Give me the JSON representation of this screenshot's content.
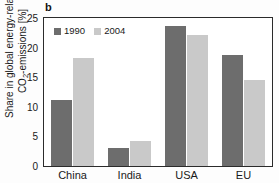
{
  "panel": {
    "label": "b"
  },
  "chart_data": {
    "type": "bar",
    "title": "",
    "subtitle": "",
    "panel_label": "b",
    "categories": [
      "China",
      "India",
      "USA",
      "EU"
    ],
    "series": [
      {
        "name": "1990",
        "color": "#6d6d6d",
        "values": [
          11.2,
          3.0,
          23.7,
          18.7
        ]
      },
      {
        "name": "2004",
        "color": "#c9c9c9",
        "values": [
          18.3,
          4.3,
          22.2,
          14.5
        ]
      }
    ],
    "xlabel": "",
    "ylabel": "Share in global energy-related CO2-emissions [%]",
    "ylabel_line1": "Share in global energy-related",
    "ylabel_line2_pre": "CO",
    "ylabel_line2_sub": "2",
    "ylabel_line2_post": "-emissions [%]",
    "ylim": [
      0,
      25
    ],
    "yticks": [
      0,
      5,
      10,
      15,
      20,
      25
    ],
    "ytick_labels": [
      "0",
      "5",
      "10",
      "15",
      "20",
      "25"
    ],
    "grid": false,
    "legend_position": "upper-left-inside",
    "frame": true
  },
  "legend": {
    "entries": [
      {
        "label": "1990",
        "color": "#6d6d6d"
      },
      {
        "label": "2004",
        "color": "#c9c9c9"
      }
    ]
  },
  "axis": {
    "y_tick_labels": [
      "25",
      "20",
      "15",
      "10",
      "5",
      "0"
    ],
    "x_tick_labels": [
      "China",
      "India",
      "USA",
      "EU"
    ]
  }
}
